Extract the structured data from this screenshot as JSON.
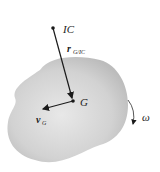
{
  "diagram": {
    "labels": {
      "ic": "IC",
      "r_main": "r",
      "r_sub": "G/IC",
      "g": "G",
      "v_main": "v",
      "v_sub": "G",
      "omega": "ω"
    },
    "colors": {
      "body_fill": "#c8c8c8",
      "body_center": "#e6e6e6",
      "ink": "#1a1a1a"
    }
  }
}
